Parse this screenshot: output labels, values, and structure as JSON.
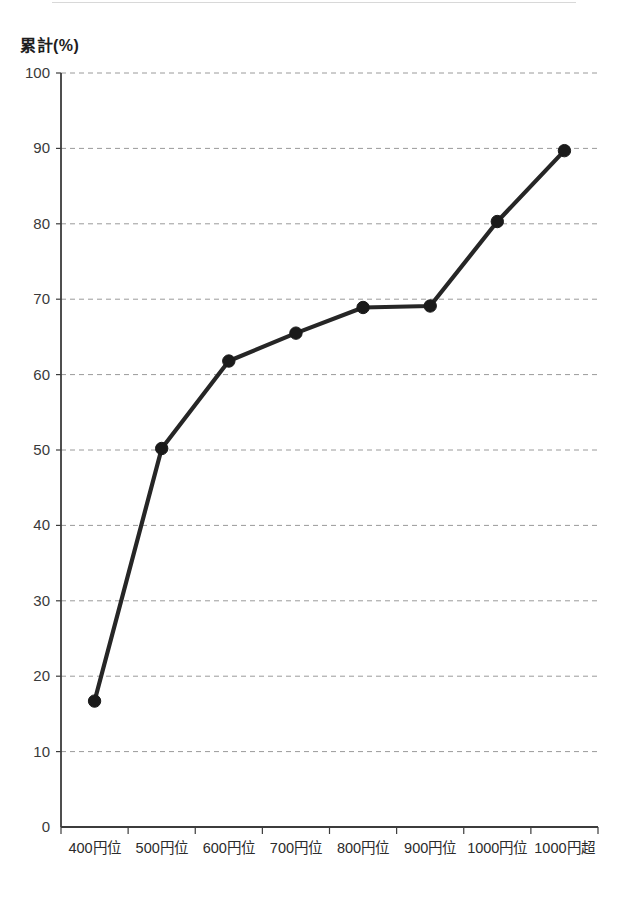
{
  "figure": {
    "y_axis_title": "累計(%)",
    "background_color": "#ffffff",
    "line_color": "#262626",
    "marker_color": "#1a1a1a",
    "grid_color": "#9a9a9a",
    "axis_color": "#3c3c3c"
  },
  "chart_data": {
    "type": "line",
    "title": "",
    "xlabel": "",
    "ylabel": "累計(%)",
    "categories": [
      "400円位",
      "500円位",
      "600円位",
      "700円位",
      "800円位",
      "900円位",
      "1000円位",
      "1000円超"
    ],
    "values": [
      16.7,
      50.2,
      61.8,
      65.5,
      68.9,
      69.1,
      80.3,
      89.7
    ],
    "ylim": [
      0,
      100
    ],
    "ytick_labels": [
      "0",
      "10",
      "20",
      "30",
      "40",
      "50",
      "60",
      "70",
      "80",
      "90",
      "100"
    ],
    "ytick_values": [
      0,
      10,
      20,
      30,
      40,
      50,
      60,
      70,
      80,
      90,
      100
    ],
    "grid": "horizontal-dashed",
    "legend": "none",
    "markers": "filled-circle"
  }
}
